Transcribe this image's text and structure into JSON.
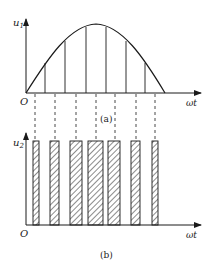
{
  "figure": {
    "panel_a": {
      "y_label": "u",
      "y_label_sub": "1",
      "x_label": "ωt",
      "origin_label": "O",
      "caption": "(a)",
      "curve": "half-sine",
      "chord_count": 6
    },
    "panel_b": {
      "y_label": "u",
      "y_label_sub": "2",
      "x_label": "ωt",
      "origin_label": "O",
      "caption": "(b)",
      "pulse_count": 7,
      "pulse_style": "hatched",
      "pulse_widths_relative": [
        1,
        2,
        3,
        4,
        3,
        2,
        1
      ]
    },
    "colors": {
      "ink": "#1a1a1a",
      "background": "#ffffff"
    }
  }
}
